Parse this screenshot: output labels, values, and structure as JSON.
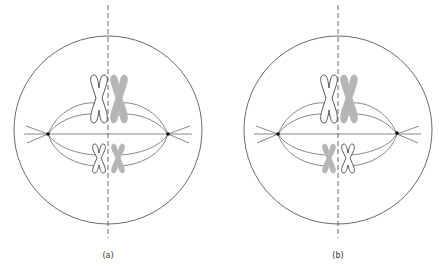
{
  "panels": [
    {
      "id": "a",
      "label": "(a)",
      "center_x": 108,
      "top_pair": [
        "white",
        "gray"
      ],
      "bottom_pair": [
        "white",
        "gray"
      ]
    },
    {
      "id": "b",
      "label": "(b)",
      "center_x": 338,
      "top_pair": [
        "white",
        "gray"
      ],
      "bottom_pair": [
        "gray",
        "white"
      ]
    }
  ],
  "colors": {
    "line": "#333333",
    "gray_chromosome": "#b5b5b5",
    "white_chromosome": "#ffffff"
  }
}
